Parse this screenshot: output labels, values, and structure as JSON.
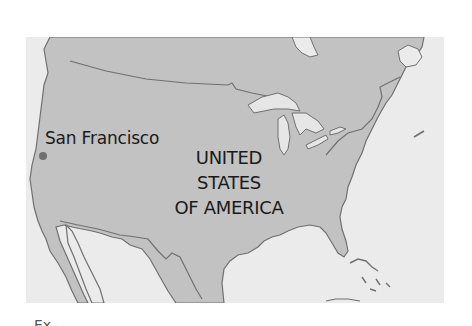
{
  "map": {
    "colors": {
      "land": "#c2c2c2",
      "water": "#ebebeb",
      "border": "#707070",
      "lakes": "#e6e6e6",
      "marker": "#6f6f6f",
      "label": "#1a1a1a"
    },
    "cities": [
      {
        "name": "San Francisco",
        "marker": "dot"
      }
    ],
    "country_label": {
      "lines": [
        "UNITED",
        "STATES",
        "OF AMERICA"
      ]
    }
  },
  "footer": {
    "partial_text": "Ex"
  }
}
